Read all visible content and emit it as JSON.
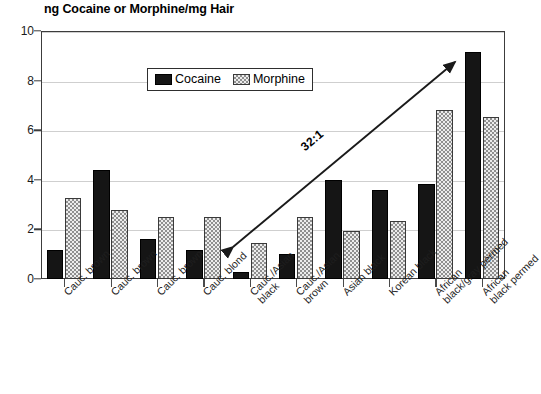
{
  "chart_data": {
    "type": "bar",
    "title": "ng Cocaine or Morphine/mg Hair",
    "xlabel": "",
    "ylabel": "ng Cocaine or Morphine/mg Hair",
    "ylim": [
      0,
      10
    ],
    "yticks": [
      0,
      2,
      4,
      6,
      8,
      10
    ],
    "ytick_labels": [
      "0",
      "2",
      "4",
      "6",
      "8",
      "10"
    ],
    "grid": true,
    "grid_axis": "y",
    "legend_position": "top-center-inside",
    "categories": [
      "Cauc. brown",
      "Cauc. brown",
      "Cauc. brown",
      "Cauc. blond",
      "Cauc./Asian black",
      "Cauc./Asian brown",
      "Asian black",
      "Korean black",
      "African black/gray permed",
      "African black permed"
    ],
    "category_lines": [
      [
        "Cauc. brown"
      ],
      [
        "Cauc. brown"
      ],
      [
        "Cauc. brown"
      ],
      [
        "Cauc. blond"
      ],
      [
        "Cauc./Asian",
        "black"
      ],
      [
        "Cauc./Asian",
        "brown"
      ],
      [
        "Asian black"
      ],
      [
        "Korean black"
      ],
      [
        "African",
        "black/gray permed"
      ],
      [
        "African",
        "black permed"
      ]
    ],
    "series": [
      {
        "name": "Cocaine",
        "color": "#151515",
        "pattern": "solid",
        "values": [
          1.15,
          4.4,
          1.6,
          1.15,
          0.3,
          1.0,
          4.0,
          3.6,
          3.85,
          9.15
        ]
      },
      {
        "name": "Morphine",
        "color": "#ececec",
        "pattern": "checkerboard",
        "values": [
          3.25,
          2.8,
          2.5,
          2.5,
          1.45,
          2.5,
          1.95,
          2.35,
          6.8,
          6.55
        ]
      }
    ],
    "annotations": [
      {
        "text": "32:1",
        "type": "arrow-label",
        "arrow_from": [
          233,
          247
        ],
        "arrow_to": [
          455,
          62
        ]
      }
    ]
  },
  "legend": {
    "items": [
      {
        "label": "Cocaine",
        "swatch": "solid-black-swatch"
      },
      {
        "label": "Morphine",
        "swatch": "checkered-swatch"
      }
    ]
  }
}
